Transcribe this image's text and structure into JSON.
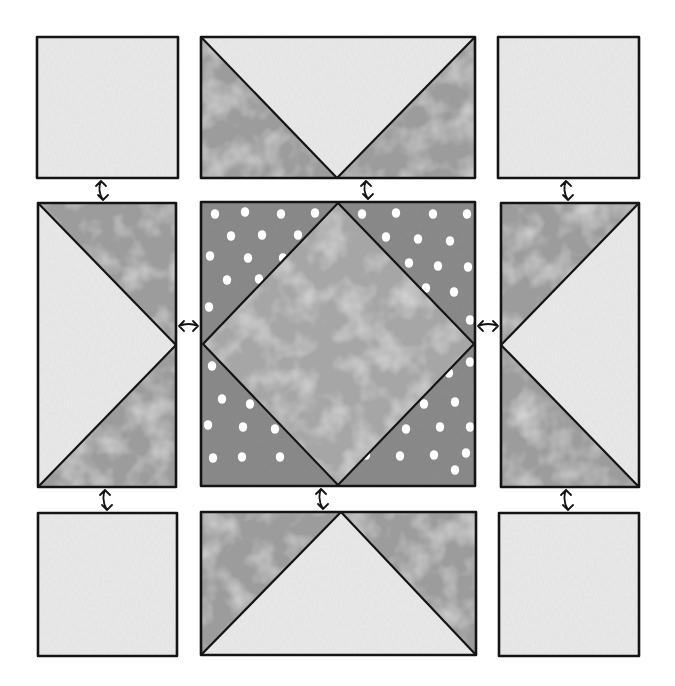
{
  "diagram": {
    "colors": {
      "background": "#ffffff",
      "light_fabric": "#ebebeb",
      "medium_fabric": "#9c9c9c",
      "center_diamond": "#a6a6a6",
      "polka_background": "#8c8c8c",
      "polka_dot": "#ffffff",
      "outline": "#141414"
    },
    "blocks": [
      {
        "id": "top-left",
        "type": "plain-square",
        "fabric": "light",
        "x": 37,
        "y": 37,
        "w": 141,
        "h": 141
      },
      {
        "id": "top-center",
        "type": "flying-geese-down",
        "fabric_goose": "light",
        "fabric_sky": "medium",
        "x": 201,
        "y": 37,
        "w": 274,
        "h": 141
      },
      {
        "id": "top-right",
        "type": "plain-square",
        "fabric": "light",
        "x": 498,
        "y": 37,
        "w": 141,
        "h": 141
      },
      {
        "id": "middle-left",
        "type": "flying-geese-right",
        "fabric_goose": "light",
        "fabric_sky": "medium",
        "x": 38,
        "y": 203,
        "w": 138,
        "h": 284
      },
      {
        "id": "center",
        "type": "square-in-square",
        "fabric_center": "center_diamond",
        "fabric_corners": "polka",
        "x": 201,
        "y": 202,
        "w": 274,
        "h": 284
      },
      {
        "id": "middle-right",
        "type": "flying-geese-left",
        "fabric_goose": "light",
        "fabric_sky": "medium",
        "x": 501,
        "y": 203,
        "w": 138,
        "h": 284
      },
      {
        "id": "bottom-left",
        "type": "plain-square",
        "fabric": "light",
        "x": 38,
        "y": 513,
        "w": 139,
        "h": 143
      },
      {
        "id": "bottom-center",
        "type": "flying-geese-up",
        "fabric_goose": "light",
        "fabric_sky": "medium",
        "x": 201,
        "y": 512,
        "w": 275,
        "h": 143
      },
      {
        "id": "bottom-right",
        "type": "plain-square",
        "fabric": "light",
        "x": 499,
        "y": 513,
        "w": 140,
        "h": 143
      }
    ],
    "connectors": [
      {
        "id": "arrow-tl-ml",
        "orientation": "vertical",
        "x": 102,
        "y1": 179,
        "y2": 202
      },
      {
        "id": "arrow-tc-c",
        "orientation": "vertical",
        "x": 367,
        "y1": 179,
        "y2": 201
      },
      {
        "id": "arrow-tr-mr",
        "orientation": "vertical",
        "x": 567,
        "y1": 179,
        "y2": 202
      },
      {
        "id": "arrow-ml-c",
        "orientation": "horizontal",
        "y": 326,
        "x1": 177,
        "x2": 200
      },
      {
        "id": "arrow-c-mr",
        "orientation": "horizontal",
        "y": 326,
        "x1": 476,
        "x2": 500
      },
      {
        "id": "arrow-ml-bl",
        "orientation": "vertical",
        "x": 106,
        "y1": 488,
        "y2": 512
      },
      {
        "id": "arrow-c-bc",
        "orientation": "vertical",
        "x": 322,
        "y1": 487,
        "y2": 511
      },
      {
        "id": "arrow-mr-br",
        "orientation": "vertical",
        "x": 567,
        "y1": 488,
        "y2": 512
      }
    ],
    "polka_dots": [
      [
        215,
        214
      ],
      [
        245,
        212
      ],
      [
        281,
        214
      ],
      [
        315,
        213
      ],
      [
        231,
        236
      ],
      [
        262,
        235
      ],
      [
        298,
        235
      ],
      [
        210,
        256
      ],
      [
        248,
        258
      ],
      [
        283,
        258
      ],
      [
        227,
        280
      ],
      [
        259,
        279
      ],
      [
        209,
        307
      ],
      [
        362,
        214
      ],
      [
        396,
        213
      ],
      [
        433,
        214
      ],
      [
        467,
        214
      ],
      [
        386,
        237
      ],
      [
        418,
        239
      ],
      [
        450,
        241
      ],
      [
        409,
        263
      ],
      [
        438,
        266
      ],
      [
        468,
        267
      ],
      [
        426,
        288
      ],
      [
        454,
        292
      ],
      [
        470,
        320
      ],
      [
        212,
        366
      ],
      [
        252,
        366
      ],
      [
        222,
        399
      ],
      [
        250,
        404
      ],
      [
        275,
        396
      ],
      [
        208,
        425
      ],
      [
        243,
        427
      ],
      [
        275,
        429
      ],
      [
        307,
        425
      ],
      [
        213,
        458
      ],
      [
        242,
        457
      ],
      [
        280,
        457
      ],
      [
        317,
        455
      ],
      [
        470,
        362
      ],
      [
        449,
        373
      ],
      [
        455,
        402
      ],
      [
        424,
        404
      ],
      [
        470,
        427
      ],
      [
        440,
        427
      ],
      [
        406,
        429
      ],
      [
        377,
        427
      ],
      [
        466,
        453
      ],
      [
        434,
        455
      ],
      [
        400,
        456
      ],
      [
        366,
        455
      ],
      [
        455,
        470
      ],
      [
        368,
        440
      ]
    ]
  }
}
